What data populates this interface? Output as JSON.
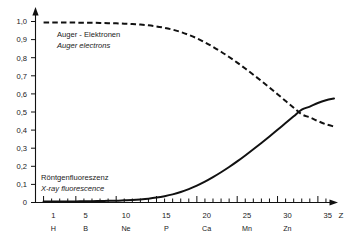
{
  "chart_data": {
    "type": "line",
    "title": "",
    "subtitle": "",
    "xlabel": "Z",
    "ylabel": "",
    "xlim": [
      0,
      38
    ],
    "ylim": [
      0,
      1.05
    ],
    "grid": false,
    "legend_position": "inline-annotation",
    "y_ticks": [
      "0",
      "0,1",
      "0,2",
      "0,3",
      "0,4",
      "0,5",
      "0,6",
      "0,7",
      "0,8",
      "0,9",
      "1,0"
    ],
    "y_tick_values": [
      0,
      0.1,
      0.2,
      0.3,
      0.4,
      0.5,
      0.6,
      0.7,
      0.8,
      0.9,
      1.0
    ],
    "x_ticks": [
      "1",
      "5",
      "10",
      "15",
      "20",
      "25",
      "30",
      "35"
    ],
    "x_tick_values": [
      1,
      5,
      10,
      15,
      20,
      25,
      30,
      35
    ],
    "x_element_labels": [
      "H",
      "B",
      "Ne",
      "P",
      "Ca",
      "Mn",
      "Zn",
      ""
    ],
    "x_minor_tick_step": 1,
    "series": [
      {
        "name": "Auger - Elektronen",
        "name_en": "Auger electrons",
        "style": "dashed",
        "color": "#111111",
        "x": [
          1,
          2,
          3,
          4,
          5,
          6,
          7,
          8,
          9,
          10,
          11,
          12,
          13,
          14,
          15,
          16,
          17,
          18,
          19,
          20,
          21,
          22,
          23,
          24,
          25,
          26,
          27,
          28,
          29,
          30,
          31,
          32,
          33,
          34,
          35,
          36,
          37
        ],
        "values": [
          0.995,
          0.995,
          0.995,
          0.994,
          0.994,
          0.993,
          0.993,
          0.992,
          0.991,
          0.99,
          0.988,
          0.986,
          0.983,
          0.979,
          0.973,
          0.965,
          0.955,
          0.942,
          0.926,
          0.907,
          0.885,
          0.86,
          0.833,
          0.804,
          0.773,
          0.74,
          0.706,
          0.671,
          0.635,
          0.598,
          0.561,
          0.524,
          0.487,
          0.47,
          0.45,
          0.432,
          0.42
        ]
      },
      {
        "name": "Röntgenfluoreszenz",
        "name_en": "X-ray fluorescence",
        "style": "solid",
        "color": "#111111",
        "x": [
          1,
          2,
          3,
          4,
          5,
          6,
          7,
          8,
          9,
          10,
          11,
          12,
          13,
          14,
          15,
          16,
          17,
          18,
          19,
          20,
          21,
          22,
          23,
          24,
          25,
          26,
          27,
          28,
          29,
          30,
          31,
          32,
          33,
          34,
          35,
          36,
          37
        ],
        "values": [
          0.005,
          0.005,
          0.005,
          0.006,
          0.006,
          0.007,
          0.007,
          0.008,
          0.009,
          0.01,
          0.012,
          0.014,
          0.017,
          0.021,
          0.027,
          0.035,
          0.045,
          0.058,
          0.074,
          0.093,
          0.115,
          0.14,
          0.167,
          0.196,
          0.227,
          0.26,
          0.294,
          0.329,
          0.365,
          0.402,
          0.439,
          0.476,
          0.513,
          0.53,
          0.55,
          0.565,
          0.575
        ]
      }
    ],
    "annotations": [
      {
        "name": "auger-annotation",
        "line_de": "Auger - Elektronen",
        "line_en": "Auger electrons",
        "x": 4,
        "y": 0.93
      },
      {
        "name": "fluorescence-annotation",
        "line_de": "Röntgenfluoreszenz",
        "line_en": "X-ray fluorescence",
        "x": 2,
        "y": 0.085
      }
    ],
    "axis_var_label": "Z"
  },
  "axes": {
    "y_tick_0": "0",
    "y_tick_1": "0,1",
    "y_tick_2": "0,2",
    "y_tick_3": "0,3",
    "y_tick_4": "0,4",
    "y_tick_5": "0,5",
    "y_tick_6": "0,6",
    "y_tick_7": "0,7",
    "y_tick_8": "0,8",
    "y_tick_9": "0,9",
    "y_tick_10": "1,0",
    "x_tick_1": "1",
    "x_tick_5": "5",
    "x_tick_10": "10",
    "x_tick_15": "15",
    "x_tick_20": "20",
    "x_tick_25": "25",
    "x_tick_30": "30",
    "x_tick_35": "35",
    "x_elem_1": "H",
    "x_elem_5": "B",
    "x_elem_10": "Ne",
    "x_elem_15": "P",
    "x_elem_20": "Ca",
    "x_elem_25": "Mn",
    "x_elem_30": "Zn",
    "x_axis_symbol": "Z"
  },
  "labels": {
    "auger_de": "Auger - Elektronen",
    "auger_en": "Auger electrons",
    "fluor_de": "Röntgenfluoreszenz",
    "fluor_en": "X-ray fluorescence"
  },
  "colors": {
    "ink": "#111111",
    "background": "#ffffff"
  }
}
